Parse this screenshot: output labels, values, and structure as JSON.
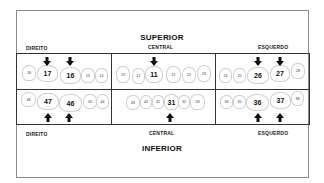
{
  "titles": {
    "top": "SUPERIOR",
    "bottom": "INFERIOR"
  },
  "sides": {
    "left": "DIREITO",
    "center": "CENTRAL",
    "right": "ESQUERDO"
  },
  "upper": {
    "right": [
      "18",
      "17",
      "16",
      "15",
      "14"
    ],
    "central": [
      "13",
      "12",
      "11",
      "21",
      "22",
      "23"
    ],
    "left": [
      "24",
      "25",
      "26",
      "27",
      "28"
    ]
  },
  "lower": {
    "right": [
      "48",
      "47",
      "46",
      "45",
      "44"
    ],
    "central": [
      "43",
      "42",
      "41",
      "31",
      "32",
      "33"
    ],
    "left": [
      "34",
      "35",
      "36",
      "37",
      "38"
    ]
  },
  "highlighted_teeth": [
    "17",
    "16",
    "11",
    "26",
    "27",
    "47",
    "46",
    "31",
    "36",
    "37"
  ],
  "arrow_icon": "down-arrow (upper) / up-arrow (lower)"
}
